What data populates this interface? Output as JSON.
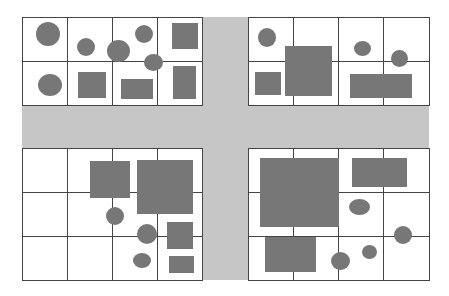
{
  "colors": {
    "road": "#c6c6c6",
    "shape": "#777777",
    "grid": "#444444",
    "block": "#ffffff"
  },
  "roads": [
    {
      "name": "horizontal-road",
      "x": 22,
      "y": 105,
      "w": 407,
      "h": 43
    },
    {
      "name": "vertical-road",
      "x": 202,
      "y": 17,
      "w": 46,
      "h": 263
    }
  ],
  "blocks": [
    {
      "name": "block-top-left",
      "x": 22,
      "y": 17,
      "cols": [
        22,
        67,
        112,
        157,
        202
      ],
      "rows": [
        17,
        61,
        105
      ]
    },
    {
      "name": "block-top-right",
      "x": 248,
      "y": 17,
      "cols": [
        248,
        293,
        338,
        383,
        429
      ],
      "rows": [
        17,
        61,
        105
      ]
    },
    {
      "name": "block-bottom-left",
      "x": 22,
      "y": 148,
      "cols": [
        22,
        67,
        112,
        157,
        202
      ],
      "rows": [
        148,
        192,
        236,
        280
      ]
    },
    {
      "name": "block-bottom-right",
      "x": 248,
      "y": 148,
      "cols": [
        248,
        293,
        338,
        383,
        429
      ],
      "rows": [
        148,
        192,
        236,
        280
      ]
    }
  ],
  "shapes": [
    {
      "t": "c",
      "x": 36,
      "y": 22,
      "w": 24,
      "h": 24
    },
    {
      "t": "c",
      "x": 77,
      "y": 38,
      "w": 18,
      "h": 18
    },
    {
      "t": "c",
      "x": 107,
      "y": 40,
      "w": 23,
      "h": 22
    },
    {
      "t": "c",
      "x": 135,
      "y": 25,
      "w": 18,
      "h": 18
    },
    {
      "t": "c",
      "x": 144,
      "y": 54,
      "w": 19,
      "h": 17
    },
    {
      "t": "r",
      "x": 172,
      "y": 23,
      "w": 26,
      "h": 26
    },
    {
      "t": "c",
      "x": 38,
      "y": 74,
      "w": 24,
      "h": 22
    },
    {
      "t": "r",
      "x": 78,
      "y": 72,
      "w": 28,
      "h": 26
    },
    {
      "t": "r",
      "x": 121,
      "y": 79,
      "w": 32,
      "h": 20
    },
    {
      "t": "r",
      "x": 173,
      "y": 66,
      "w": 23,
      "h": 33
    },
    {
      "t": "c",
      "x": 258,
      "y": 28,
      "w": 18,
      "h": 19
    },
    {
      "t": "r",
      "x": 285,
      "y": 46,
      "w": 47,
      "h": 50
    },
    {
      "t": "r",
      "x": 255,
      "y": 72,
      "w": 26,
      "h": 23
    },
    {
      "t": "c",
      "x": 354,
      "y": 41,
      "w": 17,
      "h": 15
    },
    {
      "t": "c",
      "x": 391,
      "y": 50,
      "w": 17,
      "h": 17
    },
    {
      "t": "r",
      "x": 350,
      "y": 74,
      "w": 62,
      "h": 24
    },
    {
      "t": "r",
      "x": 90,
      "y": 161,
      "w": 40,
      "h": 37
    },
    {
      "t": "r",
      "x": 137,
      "y": 160,
      "w": 56,
      "h": 54
    },
    {
      "t": "c",
      "x": 106,
      "y": 207,
      "w": 18,
      "h": 18
    },
    {
      "t": "c",
      "x": 137,
      "y": 224,
      "w": 20,
      "h": 20
    },
    {
      "t": "r",
      "x": 167,
      "y": 222,
      "w": 26,
      "h": 27
    },
    {
      "t": "c",
      "x": 133,
      "y": 253,
      "w": 18,
      "h": 15
    },
    {
      "t": "r",
      "x": 169,
      "y": 256,
      "w": 25,
      "h": 17
    },
    {
      "t": "r",
      "x": 260,
      "y": 158,
      "w": 79,
      "h": 69
    },
    {
      "t": "r",
      "x": 352,
      "y": 158,
      "w": 55,
      "h": 29
    },
    {
      "t": "c",
      "x": 349,
      "y": 199,
      "w": 21,
      "h": 16
    },
    {
      "t": "c",
      "x": 394,
      "y": 226,
      "w": 18,
      "h": 18
    },
    {
      "t": "r",
      "x": 265,
      "y": 237,
      "w": 51,
      "h": 35
    },
    {
      "t": "c",
      "x": 331,
      "y": 252,
      "w": 19,
      "h": 18
    },
    {
      "t": "c",
      "x": 362,
      "y": 245,
      "w": 15,
      "h": 14
    }
  ]
}
